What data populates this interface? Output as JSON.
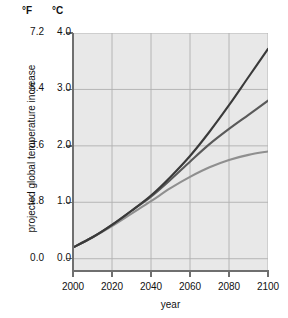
{
  "chart_data": {
    "type": "line",
    "title": "",
    "xlabel": "year",
    "ylabel": "projected global temperature increase",
    "grid": true,
    "legend": "none",
    "xlim": [
      2000,
      2100
    ],
    "x_ticks": [
      "2000",
      "2020",
      "2040",
      "2060",
      "2080",
      "2100"
    ],
    "axes": {
      "secondary_unit_header": "°F",
      "primary_unit_header": "°C",
      "fahrenheit_ticks": [
        "7.2",
        "5.4",
        "3.6",
        "1.8",
        "0.0"
      ],
      "celsius_ticks": [
        "4.0",
        "3.0",
        "2.0",
        "1.0",
        "0.0"
      ],
      "ylim_celsius": [
        -0.2,
        4.0
      ],
      "ylim_fahrenheit": [
        -0.36,
        7.2
      ]
    },
    "x": [
      2000,
      2010,
      2020,
      2030,
      2040,
      2050,
      2060,
      2070,
      2080,
      2090,
      2100
    ],
    "series": [
      {
        "name": "high-emissions-scenario",
        "color": "#3a3a3a",
        "unit": "°C",
        "values": [
          0.2,
          0.38,
          0.6,
          0.85,
          1.12,
          1.45,
          1.82,
          2.25,
          2.72,
          3.22,
          3.72
        ]
      },
      {
        "name": "medium-emissions-scenario",
        "color": "#5a5a5a",
        "unit": "°C",
        "values": [
          0.2,
          0.38,
          0.6,
          0.85,
          1.1,
          1.4,
          1.72,
          2.03,
          2.3,
          2.55,
          2.8
        ]
      },
      {
        "name": "low-emissions-scenario",
        "color": "#8f8f8f",
        "unit": "°C",
        "values": [
          0.2,
          0.38,
          0.58,
          0.8,
          1.02,
          1.25,
          1.45,
          1.62,
          1.75,
          1.84,
          1.9
        ]
      }
    ]
  },
  "colors": {
    "plot_background": "#e8e8e8",
    "gridline": "#b0b0b0",
    "axis": "#6f6f6f",
    "text": "#111111"
  }
}
